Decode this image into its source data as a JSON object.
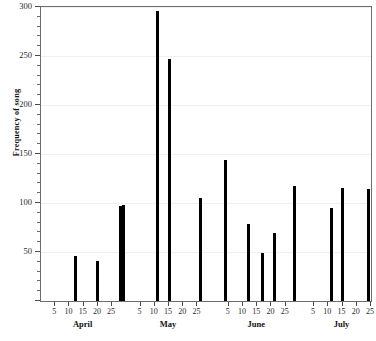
{
  "chart_data": {
    "type": "bar",
    "title": "",
    "xlabel": "",
    "ylabel": "Frequency of song",
    "ylim": [
      0,
      300
    ],
    "ytick_major": [
      0,
      50,
      100,
      150,
      200,
      250,
      300
    ],
    "ytick_major_labels": [
      "",
      "50",
      "100",
      "150",
      "200",
      "250",
      "300"
    ],
    "ytick_minor_step": 10,
    "grid": true,
    "grid_axis": "y",
    "legend": "none",
    "bar_color": "#000000",
    "x_axis_type": "date",
    "months": [
      {
        "name": "April",
        "day_ticks": [
          5,
          10,
          15,
          20,
          25
        ],
        "start_day_index": 0
      },
      {
        "name": "May",
        "day_ticks": [
          5,
          10,
          15,
          20,
          25
        ],
        "start_day_index": 30
      },
      {
        "name": "June",
        "day_ticks": [
          5,
          10,
          15,
          20,
          25
        ],
        "start_day_index": 61
      },
      {
        "name": "July",
        "day_ticks": [
          5,
          10,
          15,
          20,
          25
        ],
        "start_day_index": 91
      }
    ],
    "x_day_range": [
      0,
      116
    ],
    "points": [
      {
        "month": "April",
        "day": 12,
        "x": 12,
        "value": 46
      },
      {
        "month": "April",
        "day": 20,
        "x": 20,
        "value": 41
      },
      {
        "month": "April",
        "day": 28,
        "x": 28,
        "value": 97
      },
      {
        "month": "April",
        "day": 29,
        "x": 29,
        "value": 98
      },
      {
        "month": "May",
        "day": 11,
        "x": 41,
        "value": 296
      },
      {
        "month": "May",
        "day": 15,
        "x": 45,
        "value": 247
      },
      {
        "month": "May",
        "day": 26,
        "x": 56,
        "value": 105
      },
      {
        "month": "June",
        "day": 4,
        "x": 65,
        "value": 144
      },
      {
        "month": "June",
        "day": 12,
        "x": 73,
        "value": 79
      },
      {
        "month": "June",
        "day": 17,
        "x": 78,
        "value": 49
      },
      {
        "month": "June",
        "day": 21,
        "x": 82,
        "value": 69
      },
      {
        "month": "June",
        "day": 28,
        "x": 89,
        "value": 117
      },
      {
        "month": "July",
        "day": 11,
        "x": 102,
        "value": 95
      },
      {
        "month": "July",
        "day": 15,
        "x": 106,
        "value": 115
      },
      {
        "month": "July",
        "day": 24,
        "x": 115,
        "value": 114
      }
    ]
  },
  "axis": {
    "y_title": "Frequency of song"
  }
}
